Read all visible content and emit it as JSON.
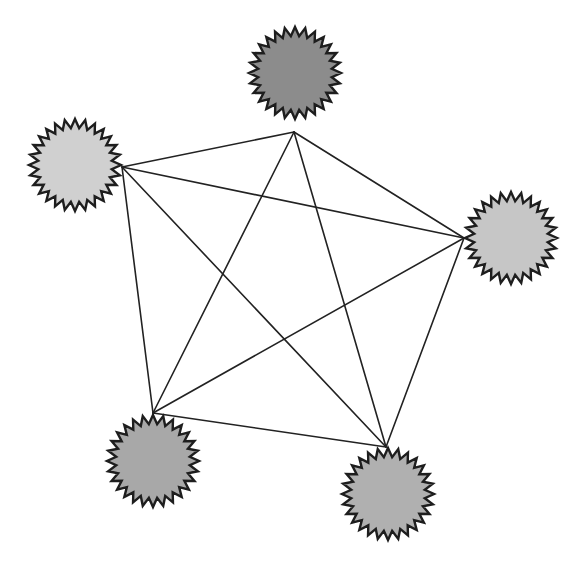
{
  "diagram": {
    "type": "complete-graph",
    "style": {
      "background": "#ffffff",
      "edge_color": "#222222",
      "outline_color": "#1e1e1e",
      "spike_count": 28
    },
    "nodes": [
      {
        "id": "top",
        "cx": 295,
        "cy": 73,
        "r_outer": 46,
        "r_inner": 37,
        "fill": "#8c8c8c",
        "anchor": [
          294,
          132
        ]
      },
      {
        "id": "left",
        "cx": 75,
        "cy": 165,
        "r_outer": 46,
        "r_inner": 37,
        "fill": "#d0d0d0",
        "anchor": [
          122,
          167
        ]
      },
      {
        "id": "right",
        "cx": 511,
        "cy": 238,
        "r_outer": 46,
        "r_inner": 37,
        "fill": "#c6c6c6",
        "anchor": [
          464,
          238
        ]
      },
      {
        "id": "bottom-left",
        "cx": 153,
        "cy": 461,
        "r_outer": 46,
        "r_inner": 37,
        "fill": "#a8a8a8",
        "anchor": [
          153,
          413
        ]
      },
      {
        "id": "bottom-right",
        "cx": 388,
        "cy": 494,
        "r_outer": 46,
        "r_inner": 37,
        "fill": "#b0b0b0",
        "anchor": [
          386,
          447
        ]
      }
    ],
    "edges": [
      [
        "top",
        "left"
      ],
      [
        "top",
        "right"
      ],
      [
        "top",
        "bottom-left"
      ],
      [
        "top",
        "bottom-right"
      ],
      [
        "left",
        "right"
      ],
      [
        "left",
        "bottom-left"
      ],
      [
        "left",
        "bottom-right"
      ],
      [
        "right",
        "bottom-left"
      ],
      [
        "right",
        "bottom-right"
      ],
      [
        "bottom-left",
        "bottom-right"
      ]
    ]
  }
}
